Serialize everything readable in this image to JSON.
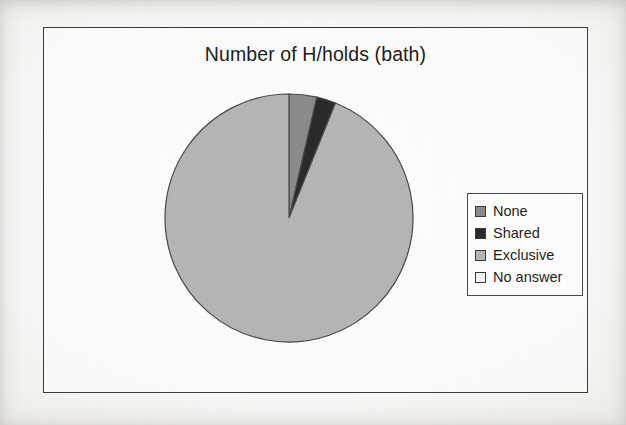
{
  "chart_data": {
    "type": "pie",
    "title": "Number of H/holds (bath)",
    "categories": [
      "None",
      "Shared",
      "Exclusive",
      "No answer"
    ],
    "values": [
      3.6,
      2.5,
      93.9,
      0
    ],
    "value_unit": "percent",
    "start_angle_deg": 0,
    "direction": "clockwise",
    "legend_position": "right",
    "grid": false,
    "xlabel": "",
    "ylabel": "",
    "slice_colors": [
      "#8c8c8c",
      "#2b2b2b",
      "#b6b6b6",
      "#f2f2f2"
    ],
    "slices": [
      {
        "label": "None",
        "value": 3.6,
        "color": "#8c8c8c",
        "sweep_deg": 13.0
      },
      {
        "label": "Shared",
        "value": 2.5,
        "color": "#2b2b2b",
        "sweep_deg": 9.0
      },
      {
        "label": "Exclusive",
        "value": 93.9,
        "color": "#b6b6b6",
        "sweep_deg": 338.0
      },
      {
        "label": "No answer",
        "value": 0,
        "color": "#f2f2f2",
        "sweep_deg": 0
      }
    ]
  },
  "chart": {
    "title": "Number of H/holds (bath)",
    "outline_color": "#3b3b3b",
    "slice_outline_color": "#4a4a4a",
    "plot_background": "#ffffff"
  },
  "legend": {
    "border_color": "#4a4a4a",
    "items": [
      {
        "label": "None",
        "color": "#8c8c8c"
      },
      {
        "label": "Shared",
        "color": "#2b2b2b"
      },
      {
        "label": "Exclusive",
        "color": "#b6b6b6"
      },
      {
        "label": "No answer",
        "color": "#f2f2f2"
      }
    ]
  }
}
